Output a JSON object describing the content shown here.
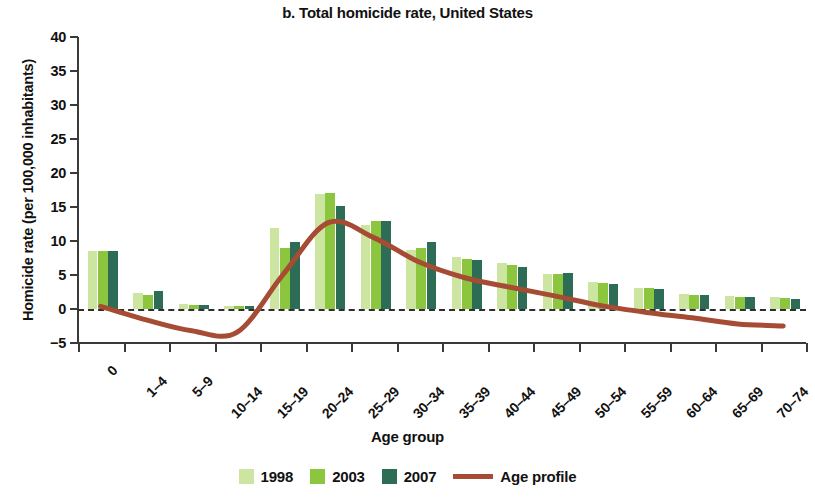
{
  "chart_data": {
    "type": "bar",
    "title": "b. Total homicide rate, United States",
    "xlabel": "Age group",
    "ylabel": "Homicide rate (per 100,000 inhabitants)",
    "ylim": [
      -5,
      40
    ],
    "ytick_values": [
      40,
      35,
      30,
      25,
      20,
      15,
      10,
      5,
      0,
      -5
    ],
    "ytick_labels": [
      "40",
      "35",
      "30",
      "25",
      "20",
      "15",
      "10",
      "5",
      "0",
      "−5"
    ],
    "grid": false,
    "legend_position": "bottom",
    "categories": [
      "0",
      "1–4",
      "5–9",
      "10–14",
      "15–19",
      "20–24",
      "25–29",
      "30–34",
      "35–39",
      "40–44",
      "45–49",
      "50–54",
      "55–59",
      "60–64",
      "65–69",
      "70–74"
    ],
    "series": [
      {
        "name": "1998",
        "color": "#cce5a1",
        "values": [
          8.6,
          2.4,
          0.7,
          0.4,
          11.9,
          16.9,
          12.3,
          8.7,
          7.6,
          6.7,
          5.2,
          3.9,
          3.1,
          2.2,
          1.9,
          1.8
        ]
      },
      {
        "name": "2003",
        "color": "#8cc63e",
        "values": [
          8.5,
          2.1,
          0.6,
          0.4,
          9.0,
          17.0,
          13.0,
          9.0,
          7.4,
          6.4,
          5.1,
          3.8,
          3.1,
          2.1,
          1.8,
          1.6
        ]
      },
      {
        "name": "2007",
        "color": "#2d6c55",
        "values": [
          8.5,
          2.7,
          0.6,
          0.4,
          9.9,
          15.2,
          13.0,
          9.8,
          7.2,
          6.2,
          5.3,
          3.7,
          2.9,
          2.1,
          1.7,
          1.4
        ]
      }
    ],
    "line_series": {
      "name": "Age profile",
      "color": "#a64b34",
      "points": [
        {
          "x": "0",
          "y": 0.4
        },
        {
          "x": "1–4",
          "y": -1.6
        },
        {
          "x": "5–9",
          "y": -3.2
        },
        {
          "x": "10–14",
          "y": -3.4
        },
        {
          "x": "15–19",
          "y": 5.0
        },
        {
          "x": "20–24",
          "y": 12.7
        },
        {
          "x": "25–29",
          "y": 10.5
        },
        {
          "x": "30–34",
          "y": 6.9
        },
        {
          "x": "35–39",
          "y": 4.6
        },
        {
          "x": "40–44",
          "y": 3.2
        },
        {
          "x": "45–49",
          "y": 1.9
        },
        {
          "x": "50–54",
          "y": 0.5
        },
        {
          "x": "55–59",
          "y": -0.5
        },
        {
          "x": "60–64",
          "y": -1.3
        },
        {
          "x": "65–69",
          "y": -2.2
        },
        {
          "x": "70–74",
          "y": -2.5
        }
      ]
    }
  },
  "legend": {
    "items": [
      {
        "label": "1998",
        "type": "swatch",
        "color": "#cce5a1"
      },
      {
        "label": "2003",
        "type": "swatch",
        "color": "#8cc63e"
      },
      {
        "label": "2007",
        "type": "swatch",
        "color": "#2d6c55"
      },
      {
        "label": "Age profile",
        "type": "line",
        "color": "#a64b34"
      }
    ]
  }
}
